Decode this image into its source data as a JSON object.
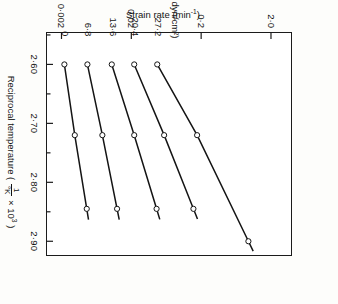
{
  "chart_data": {
    "type": "line",
    "title": "",
    "xlabel": "Reciprocal temperature ( 1/°K × 10³ )",
    "ylabel": "Strain rate (min⁻¹)",
    "x_unit_prefix": "1/°K",
    "x_unit_exponent": "3",
    "y_scale": "log",
    "xlim": [
      2.545,
      2.925
    ],
    "ylim": [
      0.0012,
      4.0
    ],
    "grid": false,
    "legend_position": "in-plot-left-labels",
    "xticks": [
      2.6,
      2.7,
      2.8,
      2.9
    ],
    "xtick_labels": [
      "2·60",
      "2·70",
      "2·80",
      "2·90"
    ],
    "x_minor_ticks": [
      2.55,
      2.65,
      2.75,
      2.85
    ],
    "yticks": [
      2.0,
      0.2,
      0.02,
      0.002
    ],
    "ytick_labels": [
      "2·0",
      "0·2",
      "0·02",
      "0·002"
    ],
    "series_units": "(×10⁻⁷ dyn/cm²)",
    "marker": "open-circle",
    "series": [
      {
        "name": "0",
        "label": "0",
        "stress": 0,
        "x": [
          2.6,
          2.72,
          2.845
        ],
        "y": [
          0.0022,
          0.0031,
          0.0046
        ]
      },
      {
        "name": "6·8",
        "label": "6·8",
        "stress": 6.8,
        "x": [
          2.6,
          2.72,
          2.845
        ],
        "y": [
          0.0047,
          0.0077,
          0.0125
        ]
      },
      {
        "name": "13·6",
        "label": "13·6",
        "stress": 13.6,
        "x": [
          2.6,
          2.72,
          2.845
        ],
        "y": [
          0.0105,
          0.022,
          0.046
        ]
      },
      {
        "name": "20·4",
        "label": "20·4",
        "stress": 20.4,
        "x": [
          2.6,
          2.72,
          2.845
        ],
        "y": [
          0.022,
          0.059,
          0.155
        ]
      },
      {
        "name": "27·2",
        "label": "27·2",
        "stress": 27.2,
        "x": [
          2.6,
          2.72,
          2.9
        ],
        "y": [
          0.047,
          0.175,
          0.95
        ]
      }
    ],
    "annotations": [
      {
        "text": "0",
        "kind": "series-label"
      },
      {
        "text": "6·8",
        "kind": "series-label"
      },
      {
        "text": "13·6",
        "kind": "series-label"
      },
      {
        "text": "20·4",
        "kind": "series-label"
      },
      {
        "text": "27·2",
        "kind": "series-label"
      },
      {
        "text": "(×10⁻⁷ dyn/cm²)",
        "kind": "units"
      }
    ]
  },
  "axes": {
    "x_title_main": "Reciprocal temperature",
    "x_title_open": "(",
    "x_title_num": "1",
    "x_title_den": "°K",
    "x_title_times": "× 10",
    "x_title_exp": "3",
    "x_title_close": ")",
    "y_title": "Strain rate  (min",
    "y_title_exp": "-1",
    "y_title_close": ")"
  },
  "style": {
    "line_color": "#141414",
    "marker_stroke": "#141414",
    "marker_fill": "#ffffff",
    "frame_color": "#1b1b1b",
    "background": "#ffffff",
    "page_background": "#fdfdfb"
  }
}
